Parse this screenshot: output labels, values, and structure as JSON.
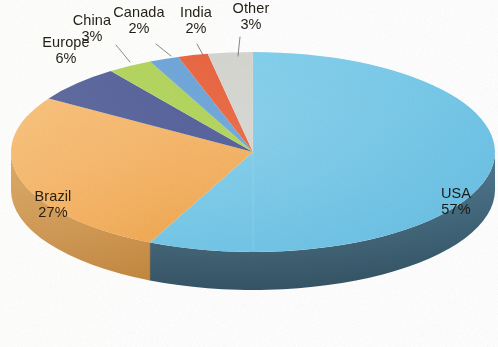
{
  "chart_data": {
    "type": "pie",
    "title": "",
    "subtitle": "",
    "xlabel": "",
    "ylabel": "",
    "legend_position": "none",
    "grid": false,
    "value_unit": "percent",
    "three_d": true,
    "categories": [
      "USA",
      "Brazil",
      "Europe",
      "China",
      "Canada",
      "India",
      "Other"
    ],
    "values": [
      57,
      27,
      6,
      3,
      2,
      2,
      3
    ],
    "labels": [
      "57%",
      "27%",
      "6%",
      "3%",
      "2%",
      "2%",
      "3%"
    ],
    "colors": [
      "#6ec6e8",
      "#f5ab52",
      "#3b4a8c",
      "#a8cf45",
      "#5b9bd5",
      "#e8532a",
      "#d2d2cd"
    ],
    "side_colors": [
      "#3d6579",
      "#c98a3c",
      "#2a3565",
      "#7d9c31",
      "#42729c",
      "#ae3b1c",
      "#a3a39c"
    ],
    "slices": [
      {
        "name": "USA",
        "value": 57,
        "label": "57%",
        "color": "#6ec6e8",
        "label_placement": "inside"
      },
      {
        "name": "Brazil",
        "value": 27,
        "label": "27%",
        "color": "#f5ab52",
        "label_placement": "inside"
      },
      {
        "name": "Europe",
        "value": 6,
        "label": "6%",
        "color": "#3b4a8c",
        "label_placement": "outside"
      },
      {
        "name": "China",
        "value": 3,
        "label": "3%",
        "color": "#a8cf45",
        "label_placement": "outside"
      },
      {
        "name": "Canada",
        "value": 2,
        "label": "2%",
        "color": "#5b9bd5",
        "label_placement": "outside"
      },
      {
        "name": "India",
        "value": 2,
        "label": "2%",
        "color": "#e8532a",
        "label_placement": "outside"
      },
      {
        "name": "Other",
        "value": 3,
        "label": "3%",
        "color": "#d2d2cd",
        "label_placement": "outside"
      }
    ]
  },
  "labels": {
    "usa": {
      "name": "USA",
      "pct": "57%"
    },
    "brazil": {
      "name": "Brazil",
      "pct": "27%"
    },
    "europe": {
      "name": "Europe",
      "pct": "6%"
    },
    "china": {
      "name": "China",
      "pct": "3%"
    },
    "canada": {
      "name": "Canada",
      "pct": "2%"
    },
    "india": {
      "name": "India",
      "pct": "2%"
    },
    "other": {
      "name": "Other",
      "pct": "3%"
    }
  },
  "palette": {
    "background": "#ffffff",
    "usa_top": "#6ec6e8",
    "usa_side": "#3d6579",
    "brazil_top": "#f5ab52",
    "brazil_side": "#c98a3c",
    "europe_top": "#3b4a8c",
    "china_top": "#a8cf45",
    "canada_top": "#5b9bd5",
    "india_top": "#e8532a",
    "other_top": "#d2d2cd",
    "label_text": "#231f16",
    "leader_line": "#6a6a64"
  }
}
